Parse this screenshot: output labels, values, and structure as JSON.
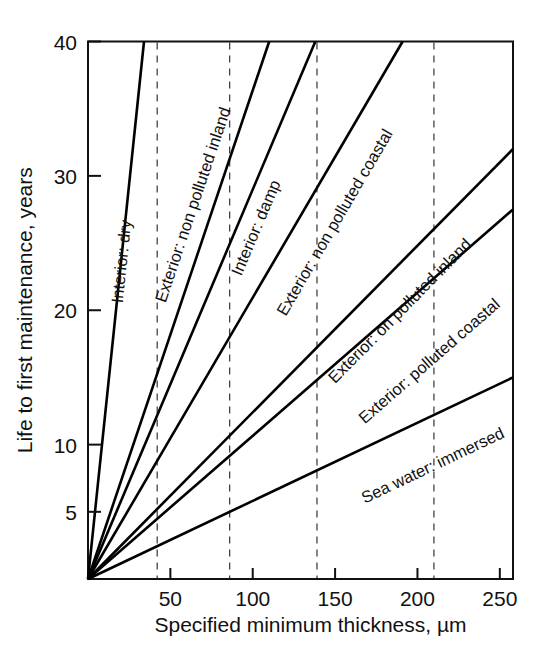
{
  "chart_data": {
    "type": "line",
    "title": "",
    "xlabel": "Specified minimum thickness, µm",
    "ylabel": "Life to first maintenance, years",
    "xlim": [
      0,
      258
    ],
    "ylim": [
      0,
      40
    ],
    "grid": false,
    "legend_position": "inline-labels",
    "xticks": [
      50,
      100,
      150,
      200,
      250
    ],
    "xtick_labels": [
      "50",
      "100",
      "150",
      "200",
      "250"
    ],
    "yticks": [
      5,
      10,
      20,
      30,
      40
    ],
    "ytick_labels": [
      "5",
      "10",
      "20",
      "30",
      "40"
    ],
    "x_units": "µm",
    "y_units": "years",
    "vertical_reference_lines": [
      {
        "name": "ref-42",
        "x": 42
      },
      {
        "name": "ref-86",
        "x": 86
      },
      {
        "name": "ref-139",
        "x": 139
      },
      {
        "name": "ref-210",
        "x": 210
      }
    ],
    "series": [
      {
        "name": "Interior: dry",
        "label": "Interior: dry",
        "slope_years_per_micron": 1.176,
        "points": [
          [
            0,
            0
          ],
          [
            34,
            40
          ]
        ],
        "label_x": 21,
        "label_y": 20.5
      },
      {
        "name": "Exterior: non polluted inland",
        "label": "Exterior: non polluted inland",
        "slope_years_per_micron": 0.364,
        "points": [
          [
            0,
            0
          ],
          [
            110,
            40
          ]
        ],
        "label_x": 47,
        "label_y": 20.5
      },
      {
        "name": "Interior: damp",
        "label": "Interior: damp",
        "slope_years_per_micron": 0.29,
        "points": [
          [
            0,
            0
          ],
          [
            138,
            40
          ]
        ],
        "label_x": 93,
        "label_y": 22.5
      },
      {
        "name": "Exterior: non polluted coastal",
        "label": "Exterior: non polluted coastal",
        "slope_years_per_micron": 0.209,
        "points": [
          [
            0,
            0
          ],
          [
            191,
            40
          ]
        ],
        "label_x": 120,
        "label_y": 19.5
      },
      {
        "name": "Exterior: on polluted inland",
        "label": "Exterior: on polluted inland",
        "slope_years_per_micron": 0.124,
        "points": [
          [
            0,
            0
          ],
          [
            258,
            32
          ]
        ],
        "label_x": 150,
        "label_y": 14.5
      },
      {
        "name": "Exterior: polluted coastal",
        "label": "Exterior: polluted coastal",
        "slope_years_per_micron": 0.107,
        "points": [
          [
            0,
            0
          ],
          [
            258,
            27.5
          ]
        ],
        "label_x": 168,
        "label_y": 11.5
      },
      {
        "name": "Sea water: immersed",
        "label": "Sea water: immersed",
        "slope_years_per_micron": 0.0581,
        "points": [
          [
            0,
            0
          ],
          [
            258,
            15
          ]
        ],
        "label_x": 168,
        "label_y": 5.6
      }
    ]
  }
}
